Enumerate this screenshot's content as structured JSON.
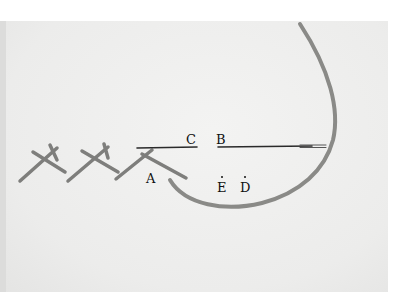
{
  "figure": {
    "labels": [
      {
        "id": "A",
        "text": "A"
      },
      {
        "id": "B",
        "text": "B"
      },
      {
        "id": "C",
        "text": "C"
      },
      {
        "id": "D",
        "text": "D"
      },
      {
        "id": "E",
        "text": "E"
      }
    ],
    "colors": {
      "background": "#ececeb",
      "thread": "#8a8a87",
      "needle": "#2a2a2a",
      "label": "#111111"
    }
  }
}
